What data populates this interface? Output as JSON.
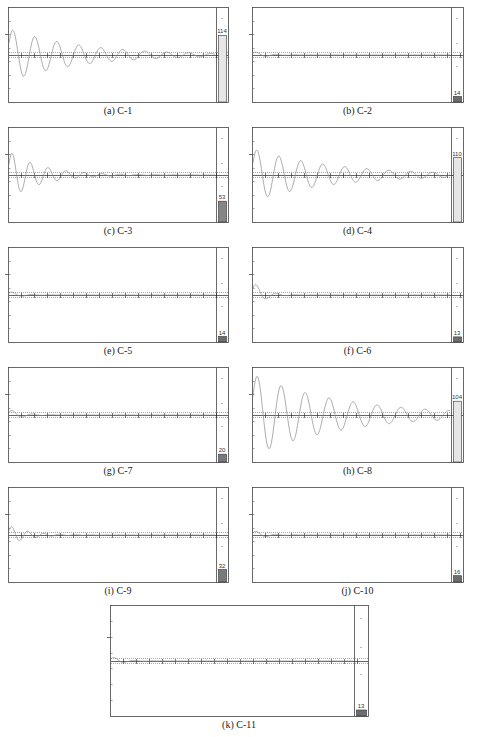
{
  "figure_caption": "",
  "chart_data": [
    {
      "id": "a",
      "label": "(a) C-1",
      "type": "line",
      "title": "C-1",
      "bar_value": 114,
      "bar_color": "#e6e6e6",
      "amplitude": 0.55,
      "decay": 0.055,
      "period": 22,
      "col": 0,
      "row": 0
    },
    {
      "id": "b",
      "label": "(b) C-2",
      "type": "line",
      "title": "C-2",
      "bar_value": 14,
      "bar_color": "#6d6d6d",
      "amplitude": 0.08,
      "decay": 0.35,
      "period": 20,
      "col": 1,
      "row": 0
    },
    {
      "id": "c",
      "label": "(c) C-3",
      "type": "line",
      "title": "C-3",
      "bar_value": 53,
      "bar_color": "#858585",
      "amplitude": 0.5,
      "decay": 0.12,
      "period": 18,
      "col": 0,
      "row": 1
    },
    {
      "id": "d",
      "label": "(d) C-4",
      "type": "line",
      "title": "C-4",
      "bar_value": 110,
      "bar_color": "#e6e6e6",
      "amplitude": 0.55,
      "decay": 0.05,
      "period": 22,
      "col": 1,
      "row": 1
    },
    {
      "id": "e",
      "label": "(e) C-5",
      "type": "line",
      "title": "C-5",
      "bar_value": 14,
      "bar_color": "#6d6d6d",
      "amplitude": 0.08,
      "decay": 0.35,
      "period": 20,
      "col": 0,
      "row": 2
    },
    {
      "id": "f",
      "label": "(f) C-6",
      "type": "line",
      "title": "C-6",
      "bar_value": 13,
      "bar_color": "#6d6d6d",
      "amplitude": 0.3,
      "decay": 0.4,
      "period": 20,
      "col": 1,
      "row": 2
    },
    {
      "id": "g",
      "label": "(g) C-7",
      "type": "line",
      "title": "C-7",
      "bar_value": 20,
      "bar_color": "#7a7a7a",
      "amplitude": 0.12,
      "decay": 0.3,
      "period": 20,
      "col": 0,
      "row": 3
    },
    {
      "id": "h",
      "label": "(h) C-8",
      "type": "line",
      "title": "C-8",
      "bar_value": 104,
      "bar_color": "#e6e6e6",
      "amplitude": 0.85,
      "decay": 0.045,
      "period": 24,
      "col": 1,
      "row": 3
    },
    {
      "id": "i",
      "label": "(i) C-9",
      "type": "line",
      "title": "C-9",
      "bar_value": 32,
      "bar_color": "#7a7a7a",
      "amplitude": 0.2,
      "decay": 0.2,
      "period": 16,
      "col": 0,
      "row": 4
    },
    {
      "id": "j",
      "label": "(j) C-10",
      "type": "line",
      "title": "C-10",
      "bar_value": 16,
      "bar_color": "#6d6d6d",
      "amplitude": 0.1,
      "decay": 0.35,
      "period": 20,
      "col": 1,
      "row": 4
    },
    {
      "id": "k",
      "label": "(k) C-11",
      "type": "line",
      "title": "C-11",
      "bar_value": 13,
      "bar_color": "#6d6d6d",
      "amplitude": 0.08,
      "decay": 0.35,
      "period": 20,
      "col": "center",
      "row": 5
    }
  ],
  "layout": {
    "bar_max": 120,
    "grid": false,
    "line_color": "#888888",
    "frame_color": "#444444"
  }
}
